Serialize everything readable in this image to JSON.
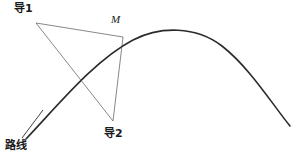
{
  "figure": {
    "width": 303,
    "height": 164,
    "background_color": "#ffffff",
    "labels": {
      "guide_1": "导1",
      "guide_2": "导2",
      "point_m": "M",
      "route": "路线"
    },
    "colors": {
      "curve": "#2b2b2b",
      "leader_line": "#555555",
      "text": "#1a1a1a"
    },
    "strokes": {
      "curve_width": 1.6,
      "leader_width": 0.7
    }
  },
  "chart_data": {
    "type": "line",
    "xlabel": "",
    "ylabel": "",
    "xlim": [
      0,
      303
    ],
    "ylim": [
      164,
      0
    ],
    "grid": false,
    "legend": "none",
    "series": [
      {
        "name": "路线",
        "kind": "curve",
        "stroke": "#2b2b2b",
        "width": 1.6,
        "path": "M 26,139 C 60,103 95,60 133,40 C 160,26 196,26 222,46 C 250,68 272,104 290,126",
        "points": [
          [
            26,
            139
          ],
          [
            60,
            103
          ],
          [
            95,
            68
          ],
          [
            123,
            43
          ],
          [
            150,
            33
          ],
          [
            175,
            31
          ],
          [
            200,
            38
          ],
          [
            225,
            54
          ],
          [
            250,
            78
          ],
          [
            272,
            103
          ],
          [
            290,
            126
          ]
        ],
        "apex": [
          172,
          31
        ]
      },
      {
        "name": "导1",
        "kind": "leader",
        "stroke": "#555555",
        "width": 0.7,
        "points": [
          [
            36,
            23
          ],
          [
            123,
            37
          ]
        ]
      },
      {
        "name": "导1-下支",
        "kind": "leader",
        "stroke": "#555555",
        "width": 0.7,
        "points": [
          [
            36,
            23
          ],
          [
            113,
            121
          ]
        ]
      },
      {
        "name": "导2",
        "kind": "leader",
        "stroke": "#555555",
        "width": 0.7,
        "points": [
          [
            123,
            37
          ],
          [
            113,
            121
          ]
        ]
      },
      {
        "name": "路线引线",
        "kind": "leader",
        "stroke": "#2b2b2b",
        "width": 0.9,
        "points": [
          [
            22,
            138
          ],
          [
            43,
            110
          ]
        ]
      }
    ],
    "annotations": [
      {
        "text": "导1",
        "x": 14,
        "y": 3,
        "style": "cjk"
      },
      {
        "text": "M",
        "x": 111,
        "y": 14,
        "style": "math-italic"
      },
      {
        "text": "导2",
        "x": 104,
        "y": 128,
        "style": "cjk"
      },
      {
        "text": "路线",
        "x": 5,
        "y": 140,
        "style": "cjk"
      }
    ]
  }
}
